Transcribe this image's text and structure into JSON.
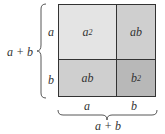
{
  "diagram": {
    "cells": [
      {
        "id": "a2",
        "base": "a",
        "exp": "2",
        "color": "#e4e4e4"
      },
      {
        "id": "ab-top",
        "label": "ab",
        "color": "#cfcfcf"
      },
      {
        "id": "ab-bottom",
        "label": "ab",
        "color": "#cfcfcf"
      },
      {
        "id": "b2",
        "base": "b",
        "exp": "2",
        "color": "#b8b8b8"
      }
    ],
    "left_labels": {
      "top": "a",
      "bottom": "b",
      "total": "a + b"
    },
    "bottom_labels": {
      "left": "a",
      "right": "b",
      "total": "a + b"
    }
  }
}
